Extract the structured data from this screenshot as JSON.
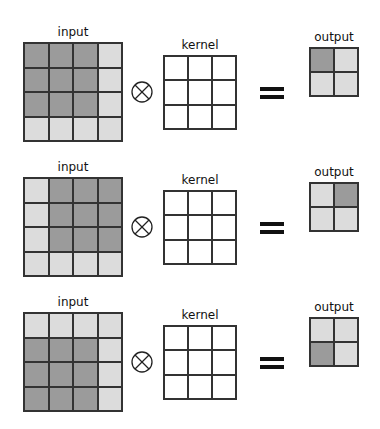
{
  "labels": {
    "input": "input",
    "kernel": "kernel",
    "output": "output"
  },
  "colors": {
    "active": "#9b9b9b",
    "inactive": "#dcdcdc",
    "kernel": "#ffffff",
    "border": "#333333"
  },
  "rows": [
    {
      "input": [
        [
          1,
          1,
          1,
          0
        ],
        [
          1,
          1,
          1,
          0
        ],
        [
          1,
          1,
          1,
          0
        ],
        [
          0,
          0,
          0,
          0
        ]
      ],
      "kernel": [
        [
          0,
          0,
          0
        ],
        [
          0,
          0,
          0
        ],
        [
          0,
          0,
          0
        ]
      ],
      "output": [
        [
          1,
          0
        ],
        [
          0,
          0
        ]
      ]
    },
    {
      "input": [
        [
          0,
          1,
          1,
          1
        ],
        [
          0,
          1,
          1,
          1
        ],
        [
          0,
          1,
          1,
          1
        ],
        [
          0,
          0,
          0,
          0
        ]
      ],
      "kernel": [
        [
          0,
          0,
          0
        ],
        [
          0,
          0,
          0
        ],
        [
          0,
          0,
          0
        ]
      ],
      "output": [
        [
          0,
          1
        ],
        [
          0,
          0
        ]
      ]
    },
    {
      "input": [
        [
          0,
          0,
          0,
          0
        ],
        [
          1,
          1,
          1,
          0
        ],
        [
          1,
          1,
          1,
          0
        ],
        [
          1,
          1,
          1,
          0
        ]
      ],
      "kernel": [
        [
          0,
          0,
          0
        ],
        [
          0,
          0,
          0
        ],
        [
          0,
          0,
          0
        ]
      ],
      "output": [
        [
          0,
          0
        ],
        [
          1,
          0
        ]
      ]
    }
  ]
}
